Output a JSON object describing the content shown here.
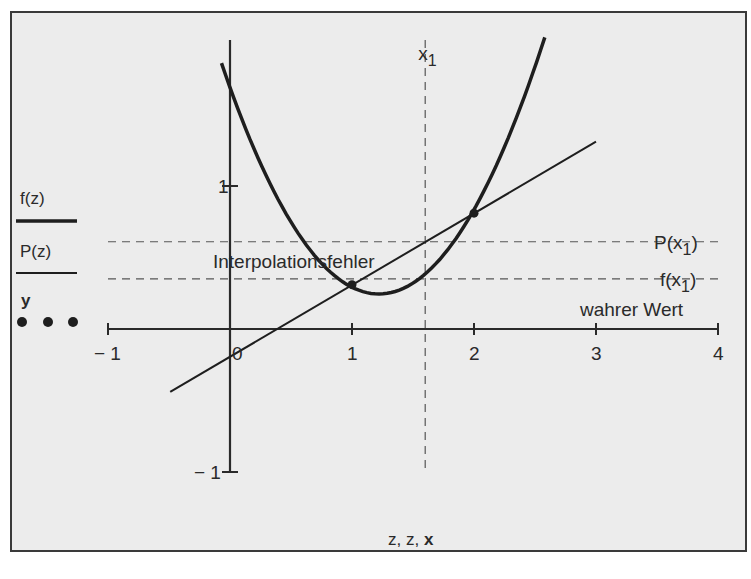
{
  "chart_data": {
    "type": "line",
    "title": "",
    "xlabel": "z, z, x",
    "ylabel": "",
    "xlim": [
      -1,
      4
    ],
    "ylim": [
      -1,
      2
    ],
    "grid": false,
    "x_ticks": [
      -1,
      0,
      1,
      2,
      3,
      4
    ],
    "x_tick_labels": [
      "− 1",
      "0",
      "1",
      "2",
      "3",
      "4"
    ],
    "y_ticks": [
      1,
      -1
    ],
    "y_tick_labels": [
      "1",
      "− 1"
    ],
    "legend_position": "left",
    "legend": [
      {
        "label": "f(z)",
        "style": "thick-solid"
      },
      {
        "label": "P(z)",
        "style": "thin-solid"
      },
      {
        "label": "y",
        "style": "dots"
      }
    ],
    "series": [
      {
        "name": "f(z)",
        "kind": "parabola",
        "formula": "0.97*(z-1.22)^2+0.245",
        "x_range": [
          -0.07,
          2.58
        ],
        "color": "#1e1e1e"
      },
      {
        "name": "P(z)",
        "kind": "line",
        "points": [
          [
            -0.49,
            -0.44
          ],
          [
            3.0,
            1.31
          ]
        ],
        "color": "#1e1e1e"
      },
      {
        "name": "y",
        "kind": "points",
        "points": [
          [
            1,
            0.31
          ],
          [
            2,
            0.81
          ]
        ],
        "color": "#1e1e1e"
      }
    ],
    "reference_lines": {
      "vertical": {
        "x": 1.6,
        "label": "x",
        "label_sub": "1",
        "y_range": [
          -1,
          2
        ]
      },
      "horizontal": [
        {
          "y": 0.61,
          "label": "P(x₁)",
          "label_main": "P",
          "label_arg": "x",
          "label_sub": "1"
        },
        {
          "y": 0.35,
          "label": "f(x₁)",
          "label_main": "f",
          "label_arg": "x",
          "label_sub": "1"
        }
      ]
    },
    "annotations": [
      {
        "text": "Interpolationsfehler",
        "x": 0.95,
        "y": 0.5
      },
      {
        "text": "wahrer Wert",
        "x": 3.4,
        "y": 0.1
      }
    ]
  },
  "axis_label_parts": [
    "z",
    ", ",
    "z",
    ", ",
    "x"
  ]
}
